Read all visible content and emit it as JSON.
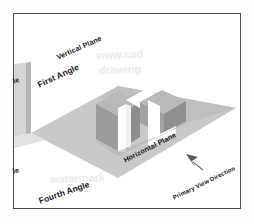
{
  "labels": {
    "vertical_plane": "Vertical Plane",
    "first_angle": "First Angle",
    "horizontal_plane": "Horizontal Plane",
    "fourth_angle": "Fourth Angle",
    "primary_view_direction": "Primary View Direction",
    "left_edge_upper_fragment": "le",
    "left_edge_lower_fragment": "le"
  },
  "watermark": {
    "line1": "www.cad",
    "line2": "drawing",
    "line3": "watermark"
  },
  "icons": {
    "view_direction_arrow": "arrow-up-left-icon"
  },
  "colors": {
    "frame_border": "#4a4a50",
    "page_background": "#ffffff",
    "horizontal_plane": "#c9c9c9",
    "horizontal_plane_far": "#bdbdbd",
    "vertical_plane": "#d4d4d4",
    "vertical_plane_edge": "#b4b4b4",
    "block_front_face": "#9a9a9a",
    "block_side_face": "#8d8d8d",
    "block_top_face": "#b8b8b8",
    "block_inner_face": "#ffffff",
    "label_text": "#17171b",
    "watermark_text": "#ececed",
    "arrow_fill": "#5b5b63"
  },
  "geometry": {
    "view": "isometric",
    "quadrants_shown": [
      "First Angle",
      "Fourth Angle"
    ],
    "object": "L-shaped channel block",
    "arrow_direction_degrees": -35
  }
}
